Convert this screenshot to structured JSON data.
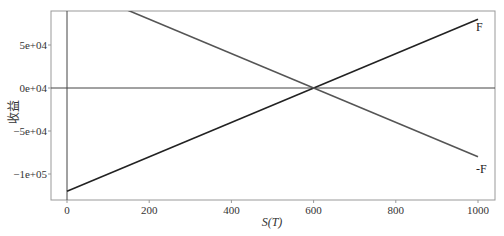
{
  "chart_data": {
    "type": "line",
    "title": "",
    "xlabel": "S(T)",
    "ylabel": "收益",
    "xlim": [
      -40,
      1040
    ],
    "ylim": [
      -135000,
      100000
    ],
    "grid": false,
    "legend": "inline labels at right end of lines",
    "x_ticks": [
      0,
      200,
      400,
      600,
      800,
      1000
    ],
    "x_tick_labels": [
      "0",
      "200",
      "400",
      "600",
      "800",
      "1000"
    ],
    "y_ticks": [
      50000,
      0,
      -50000,
      -100000
    ],
    "y_tick_labels": [
      "5e+04",
      "0e+04",
      "-5e+04",
      "-1e+05"
    ],
    "reference_lines": [
      {
        "type": "horizontal",
        "y": 0
      },
      {
        "type": "vertical",
        "x": 0
      }
    ],
    "series": [
      {
        "name": "F",
        "x": [
          0,
          1000
        ],
        "y": [
          -120000,
          80000
        ],
        "color": "#222222"
      },
      {
        "name": "-F",
        "x": [
          0,
          1000
        ],
        "y": [
          120000,
          -80000
        ],
        "color": "#555555"
      }
    ]
  }
}
